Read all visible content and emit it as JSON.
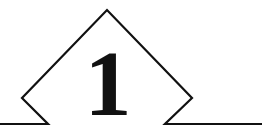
{
  "heading": {
    "type": "chapter-number-ornament",
    "number": "1"
  },
  "colors": {
    "stroke": "#111111",
    "background": "#ffffff"
  }
}
